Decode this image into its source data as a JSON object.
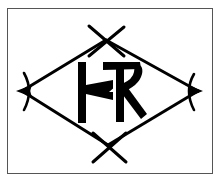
{
  "image": {
    "type": "monogram-mark",
    "description": "Diamond frame with crossed tips enclosing a ligature monogram",
    "monogram_letters": "HR",
    "colors": {
      "ink": "#000000",
      "background": "#ffffff",
      "frame_border": "#555555"
    }
  }
}
